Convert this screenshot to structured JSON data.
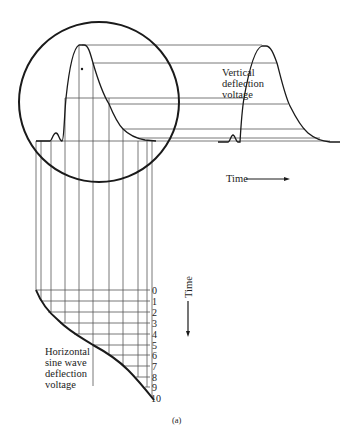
{
  "labels": {
    "vertical_voltage": [
      "Vertical",
      "deflection",
      "voltage"
    ],
    "horizontal_voltage": [
      "Horizontal",
      "sine wave",
      "deflection",
      "voltage"
    ],
    "time_horizontal": "Time",
    "time_vertical": "Time",
    "caption": "(a)"
  },
  "time_ticks": [
    "0",
    "1",
    "2",
    "3",
    "4",
    "5",
    "6",
    "7",
    "8",
    "9",
    "10"
  ],
  "colors": {
    "ink": "#1a1a1a",
    "grid": "#555555",
    "background": "#ffffff"
  }
}
